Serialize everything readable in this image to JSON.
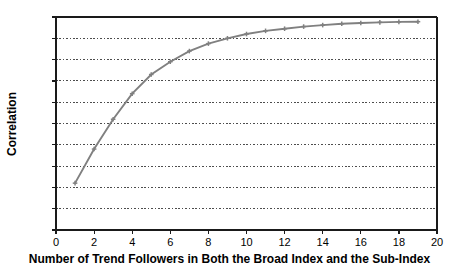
{
  "chart_data": {
    "type": "line",
    "title": "",
    "xlabel": "Number of Trend Followers in Both the Broad Index and the Sub-Index",
    "ylabel": "Correlation",
    "xlim": [
      0,
      20
    ],
    "ylim": [
      0.0,
      1.0
    ],
    "grid": "horizontal-dotted",
    "legend": "none",
    "xticks": [
      "0",
      "2",
      "4",
      "6",
      "8",
      "10",
      "12",
      "14",
      "16",
      "18",
      "20"
    ],
    "xtick_values": [
      0,
      2,
      4,
      6,
      8,
      10,
      12,
      14,
      16,
      18,
      20
    ],
    "yticks": [
      "0.0",
      "0.1",
      "0.2",
      "0.3",
      "0.4",
      "0.5",
      "0.6",
      "0.7",
      "0.8",
      "0.9",
      "1.0"
    ],
    "ytick_values": [
      0.0,
      0.1,
      0.2,
      0.3,
      0.4,
      0.5,
      0.6,
      0.7,
      0.8,
      0.9,
      1.0
    ],
    "series": [
      {
        "name": "Correlation",
        "color": "#808080",
        "marker": "cross",
        "x": [
          1,
          2,
          3,
          4,
          5,
          6,
          7,
          8,
          9,
          10,
          11,
          12,
          13,
          14,
          15,
          16,
          17,
          18,
          19
        ],
        "values": [
          0.22,
          0.38,
          0.52,
          0.64,
          0.73,
          0.79,
          0.84,
          0.875,
          0.9,
          0.92,
          0.935,
          0.945,
          0.955,
          0.962,
          0.968,
          0.972,
          0.975,
          0.977,
          0.978
        ]
      }
    ],
    "colors": {
      "line": "#808080",
      "axis": "#1a1a1a",
      "grid": "#4d4d4d",
      "text": "#000000",
      "background": "#ffffff"
    }
  }
}
